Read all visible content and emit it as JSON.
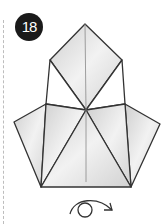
{
  "step": {
    "number": "18"
  },
  "diagram": {
    "instruction_icon": "turn-over-arrow-icon",
    "colors": {
      "paper": "#dcdcdc",
      "line": "#333333",
      "badge": "#1a1a1a"
    }
  }
}
